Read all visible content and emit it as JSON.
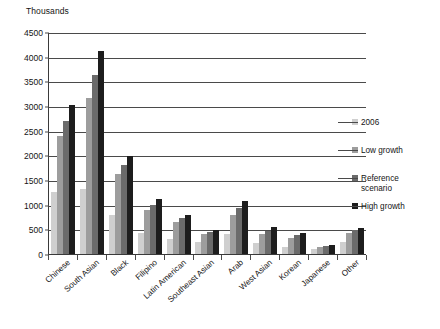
{
  "chart_data": {
    "type": "bar",
    "title": "",
    "subtitle": "",
    "unit_caption": "Thousands",
    "xlabel": "",
    "ylabel": "",
    "ylim": [
      0,
      4500
    ],
    "ytick_step": 500,
    "grid": true,
    "legend_position": "right",
    "orientation": "vertical",
    "grouping": "clustered",
    "ytick_labels": [
      "4500",
      "4000",
      "3500",
      "3000",
      "2500",
      "2000",
      "1500",
      "1000",
      "500",
      "0"
    ],
    "ytick_values": [
      4500,
      4000,
      3500,
      3000,
      2500,
      2000,
      1500,
      1000,
      500,
      0
    ],
    "categories": [
      "Chinese",
      "South Asian",
      "Black",
      "Filipino",
      "Latin American",
      "Southeast Asian",
      "Arab",
      "West Asian",
      "Korean",
      "Japanese",
      "Other"
    ],
    "series": [
      {
        "name": "2006",
        "color": "#cfcfcf",
        "values": [
          1250,
          1310,
          800,
          420,
          300,
          240,
          400,
          220,
          150,
          100,
          240
        ]
      },
      {
        "name": "Low growth",
        "color": "#9d9d9d",
        "values": [
          2400,
          3170,
          1620,
          900,
          650,
          400,
          800,
          410,
          330,
          150,
          430
        ]
      },
      {
        "name": "Reference scenario",
        "color": "#6b6b6b",
        "values": [
          2700,
          3620,
          1810,
          1000,
          720,
          450,
          930,
          470,
          380,
          170,
          480
        ]
      },
      {
        "name": "High growth",
        "color": "#1d1d1d",
        "values": [
          3020,
          4120,
          1990,
          1120,
          800,
          490,
          1080,
          540,
          430,
          190,
          530
        ]
      }
    ]
  },
  "legend": {
    "entries": [
      {
        "label": "2006",
        "label2": ""
      },
      {
        "label": "Low growth",
        "label2": ""
      },
      {
        "label": "Reference",
        "label2": "scenario"
      },
      {
        "label": "High growth",
        "label2": ""
      }
    ]
  }
}
